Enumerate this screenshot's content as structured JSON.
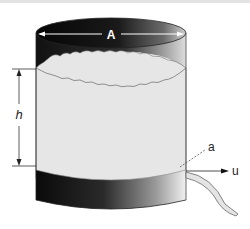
{
  "diagram": {
    "labels": {
      "area_top": "A",
      "height": "h",
      "orifice_area": "a",
      "velocity": "u"
    },
    "colors": {
      "tank_dark": "#111111",
      "fluid": "#e6e6e6",
      "jet": "#e4e4e4",
      "outline": "#555555"
    }
  }
}
